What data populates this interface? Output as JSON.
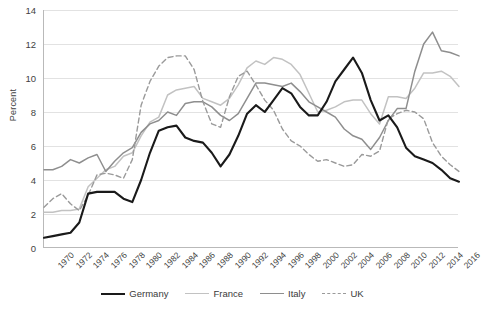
{
  "chart_data": {
    "type": "line",
    "title": "",
    "xlabel": "",
    "ylabel": "Percent",
    "ylim": [
      0,
      14
    ],
    "yticks": [
      0,
      2,
      4,
      6,
      8,
      10,
      12,
      14
    ],
    "xlim": [
      1970,
      2017
    ],
    "xticks": [
      1970,
      1972,
      1974,
      1976,
      1978,
      1980,
      1982,
      1984,
      1986,
      1988,
      1990,
      1992,
      1994,
      1996,
      1998,
      2000,
      2002,
      2004,
      2006,
      2008,
      2010,
      2012,
      2014,
      2016
    ],
    "grid": true,
    "legend_position": "bottom",
    "x": [
      1970,
      1971,
      1972,
      1973,
      1974,
      1975,
      1976,
      1977,
      1978,
      1979,
      1980,
      1981,
      1982,
      1983,
      1984,
      1985,
      1986,
      1987,
      1988,
      1989,
      1990,
      1991,
      1992,
      1993,
      1994,
      1995,
      1996,
      1997,
      1998,
      1999,
      2000,
      2001,
      2002,
      2003,
      2004,
      2005,
      2006,
      2007,
      2008,
      2009,
      2010,
      2011,
      2012,
      2013,
      2014,
      2015,
      2016,
      2017
    ],
    "series": [
      {
        "name": "Germany",
        "color": "#1a1a1a",
        "style": "solid",
        "values": [
          0.6,
          0.7,
          0.8,
          0.9,
          1.5,
          3.2,
          3.3,
          3.3,
          3.3,
          2.9,
          2.7,
          4.0,
          5.6,
          6.9,
          7.1,
          7.2,
          6.5,
          6.3,
          6.2,
          5.6,
          4.8,
          5.5,
          6.6,
          7.9,
          8.4,
          8.0,
          8.7,
          9.4,
          9.1,
          8.3,
          7.8,
          7.8,
          8.6,
          9.8,
          10.5,
          11.2,
          10.3,
          8.7,
          7.5,
          7.8,
          7.1,
          5.9,
          5.4,
          5.2,
          5.0,
          4.6,
          4.1,
          3.9
        ]
      },
      {
        "name": "France",
        "color": "#c2c2c2",
        "style": "solid",
        "values": [
          2.1,
          2.1,
          2.2,
          2.2,
          2.3,
          3.6,
          4.1,
          4.6,
          4.8,
          5.4,
          5.6,
          6.6,
          7.4,
          7.7,
          9.0,
          9.3,
          9.4,
          9.5,
          8.8,
          8.6,
          8.4,
          8.8,
          9.6,
          10.6,
          11.0,
          10.8,
          11.2,
          11.1,
          10.8,
          10.2,
          9.1,
          8.0,
          8.1,
          8.3,
          8.6,
          8.7,
          8.7,
          7.9,
          7.3,
          8.9,
          8.9,
          8.8,
          9.4,
          10.3,
          10.3,
          10.4,
          10.1,
          9.5
        ]
      },
      {
        "name": "Italy",
        "color": "#8e8e8e",
        "style": "solid",
        "values": [
          4.6,
          4.6,
          4.8,
          5.2,
          5.0,
          5.3,
          5.5,
          4.5,
          5.1,
          5.6,
          5.9,
          6.8,
          7.3,
          7.5,
          8.0,
          7.8,
          8.5,
          8.6,
          8.6,
          8.3,
          7.8,
          7.5,
          7.9,
          8.8,
          9.7,
          9.7,
          9.6,
          9.5,
          9.7,
          9.2,
          8.6,
          8.3,
          8.0,
          7.7,
          7.0,
          6.6,
          6.4,
          5.8,
          6.5,
          7.5,
          8.2,
          8.2,
          10.4,
          12.0,
          12.7,
          11.6,
          11.5,
          11.3
        ]
      },
      {
        "name": "UK",
        "color": "#9a9a9a",
        "style": "dashed",
        "values": [
          2.4,
          2.9,
          3.2,
          2.6,
          2.2,
          3.1,
          4.3,
          4.4,
          4.3,
          4.1,
          5.2,
          8.4,
          9.8,
          10.7,
          11.2,
          11.3,
          11.3,
          10.5,
          8.6,
          7.3,
          7.1,
          8.9,
          10.1,
          10.4,
          9.6,
          8.7,
          8.1,
          7.0,
          6.3,
          6.0,
          5.5,
          5.1,
          5.2,
          5.0,
          4.8,
          4.9,
          5.5,
          5.4,
          5.7,
          7.6,
          7.9,
          8.1,
          8.0,
          7.6,
          6.2,
          5.4,
          4.9,
          4.5
        ]
      }
    ]
  },
  "axes": {
    "y_title": "Percent",
    "y_tick_labels": [
      "14",
      "12",
      "10",
      "8",
      "6",
      "4",
      "2",
      "0"
    ],
    "x_tick_labels": [
      "1970",
      "1972",
      "1974",
      "1976",
      "1978",
      "1980",
      "1982",
      "1984",
      "1986",
      "1988",
      "1990",
      "1992",
      "1994",
      "1996",
      "1998",
      "2000",
      "2002",
      "2004",
      "2006",
      "2008",
      "2010",
      "2012",
      "2014",
      "2016"
    ]
  },
  "legend": {
    "items": [
      {
        "label": "Germany"
      },
      {
        "label": "France"
      },
      {
        "label": "Italy"
      },
      {
        "label": "UK"
      }
    ]
  }
}
